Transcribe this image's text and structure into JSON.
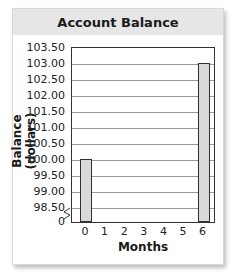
{
  "chart_data": {
    "type": "bar",
    "title": "Account Balance",
    "xlabel": "Months",
    "ylabel": "Balance (dollars)",
    "categories": [
      "0",
      "1",
      "2",
      "3",
      "4",
      "5",
      "6"
    ],
    "values": [
      100.0,
      null,
      null,
      null,
      null,
      null,
      103.0
    ],
    "y_ticks": [
      "0",
      "98.50",
      "99.00",
      "99.50",
      "100.00",
      "100.50",
      "101.00",
      "101.50",
      "102.00",
      "102.50",
      "103.00",
      "103.50"
    ],
    "ylim": [
      98.0,
      103.5
    ],
    "axis_break": true,
    "grid": true,
    "bar_color": "#d9d9d9"
  }
}
